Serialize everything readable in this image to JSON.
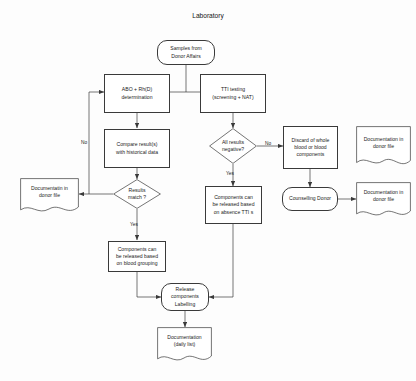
{
  "diagram": {
    "title": "Laboratory",
    "type": "flowchart",
    "nodes": {
      "start": {
        "label": "Samples from\nDonor Affairs",
        "shape": "terminator"
      },
      "abo": {
        "label": "ABO + Rh(D)\ndetermination",
        "shape": "process"
      },
      "tti": {
        "label": "TTI testing\n(screening + NAT)",
        "shape": "process"
      },
      "compare": {
        "label": "Compare result(s)\nwith historical data",
        "shape": "process"
      },
      "all_neg": {
        "label": "All results\nnegative?",
        "shape": "decision"
      },
      "discard": {
        "label": "Discard of whole\nblood or blood\ncomponents",
        "shape": "process"
      },
      "doc_donor_top": {
        "label": "Documentation in\ndonor file",
        "shape": "document"
      },
      "results_match": {
        "label": "Results\nmatch ?",
        "shape": "decision"
      },
      "doc_donor_left": {
        "label": "Documentatin in\ndonor file",
        "shape": "document"
      },
      "release_tti": {
        "label": "Components can\nbe released based\non absence TTI s",
        "shape": "process"
      },
      "counselling": {
        "label": "Counselling Donor",
        "shape": "terminator"
      },
      "doc_donor_right": {
        "label": "Documentation in\ndonor file",
        "shape": "document"
      },
      "release_group": {
        "label": "Components can\nbe released based\non blood grouping",
        "shape": "process"
      },
      "release_label": {
        "label": "Release\ncomponents\nLabelling",
        "shape": "terminator"
      },
      "doc_daily": {
        "label": "Documentation\n(daily list)",
        "shape": "document"
      }
    },
    "edge_labels": {
      "no_left": "No",
      "no_right": "No",
      "yes_left": "Yes",
      "yes_right": "Yes"
    },
    "colors": {
      "stroke": "#3a3a3a",
      "text": "#1b1b1b",
      "background": "#fdfdfd"
    }
  }
}
